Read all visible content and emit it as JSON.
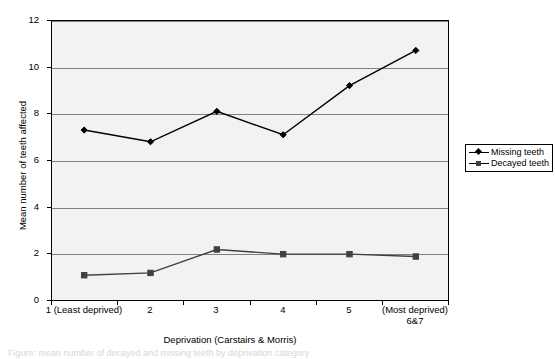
{
  "chart_data": {
    "type": "line",
    "title": "",
    "xlabel": "Deprivation (Carstairs & Morris)",
    "ylabel": "Mean number of teeth affected",
    "categories": [
      "1 (Least deprived)",
      "2",
      "3",
      "4",
      "5",
      "(Most deprived) 6&7"
    ],
    "category_lines": [
      [
        "1 (Least deprived)"
      ],
      [
        "2"
      ],
      [
        "3"
      ],
      [
        "4"
      ],
      [
        "5"
      ],
      [
        "(Most deprived)",
        "6&7"
      ]
    ],
    "series": [
      {
        "name": "Missing teeth",
        "marker": "diamond",
        "color": "#000000",
        "values": [
          7.3,
          6.8,
          8.1,
          7.1,
          9.2,
          10.7
        ]
      },
      {
        "name": "Decayed teeth",
        "marker": "square",
        "color": "#404040",
        "values": [
          1.1,
          1.2,
          2.2,
          2.0,
          2.0,
          1.9
        ]
      }
    ],
    "ylim": [
      0,
      12
    ],
    "ytick_values": [
      0,
      2,
      4,
      6,
      8,
      10,
      12
    ],
    "ytick_labels": [
      "0",
      "2",
      "4",
      "6",
      "8",
      "10",
      "12"
    ],
    "grid": true,
    "gridline_color": "#808080",
    "plot_background": "#f2f2f2",
    "legend_position": "right"
  },
  "legend": {
    "entries": [
      {
        "label": "Missing teeth"
      },
      {
        "label": "Decayed teeth"
      }
    ]
  },
  "caption": {
    "text": "Figure: mean number of decayed and missing teeth by deprivation category"
  }
}
